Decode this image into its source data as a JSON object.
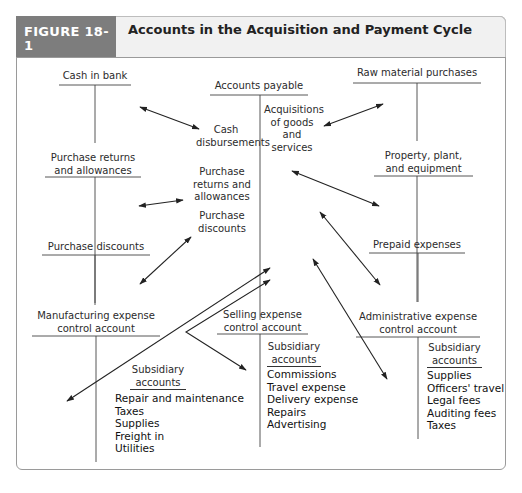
{
  "figure": {
    "tag": "FIGURE 18-1",
    "title": "Accounts in the Acquisition and Payment Cycle"
  },
  "accounts": {
    "cash_in_bank": "Cash in bank",
    "accounts_payable": "Accounts payable",
    "raw_material_purchases": "Raw material purchases",
    "purchase_returns": [
      "Purchase returns",
      "and allowances"
    ],
    "property_plant": [
      "Property, plant,",
      "and equipment"
    ],
    "purchase_discounts": "Purchase discounts",
    "prepaid_expenses": "Prepaid expenses",
    "manufacturing": [
      "Manufacturing expense",
      "control account"
    ],
    "selling": [
      "Selling expense",
      "control account"
    ],
    "administrative": [
      "Administrative expense",
      "control account"
    ]
  },
  "flows": {
    "cash_disbursements": [
      "Cash",
      "disbursements"
    ],
    "acquisitions": [
      "Acquisitions",
      "of goods",
      "and",
      "services"
    ],
    "purchase_returns": [
      "Purchase",
      "returns and",
      "allowances"
    ],
    "purchase_discounts": [
      "Purchase",
      "discounts"
    ]
  },
  "subsidiary": {
    "heading": [
      "Subsidiary",
      "accounts"
    ],
    "manufacturing": [
      "Repair and maintenance",
      "Taxes",
      "Supplies",
      "Freight in",
      "Utilities"
    ],
    "selling": [
      "Commissions",
      "Travel expense",
      "Delivery expense",
      "Repairs",
      "Advertising"
    ],
    "administrative": [
      "Supplies",
      "Officers' travel",
      "Legal fees",
      "Auditing fees",
      "Taxes"
    ]
  },
  "colors": {
    "tag_bg": "#7d7d7d",
    "band_bg": "#f1f1f1",
    "line": "#222222"
  }
}
